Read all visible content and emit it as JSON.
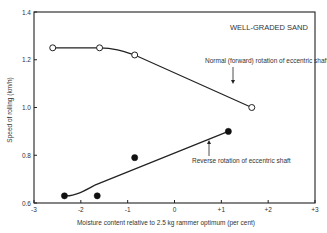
{
  "chart_data": {
    "type": "line",
    "title": "WELL-GRADED SAND",
    "xlabel": "Moisture content relative to 2.5 kg rammer optimum (per cent)",
    "ylabel": "Speed of rolling (km/h)",
    "xlim": [
      -3,
      3
    ],
    "ylim": [
      0.6,
      1.4
    ],
    "xticks": [
      -3,
      -2,
      -1,
      0,
      1,
      2,
      3
    ],
    "xtick_labels": [
      "-3",
      "-2",
      "-1",
      "0",
      "+1",
      "+2",
      "+3"
    ],
    "yticks": [
      0.6,
      0.8,
      1.0,
      1.2,
      1.4
    ],
    "ytick_labels": [
      "0.6",
      "0.8",
      "1.0",
      "1.2",
      "1.4"
    ],
    "grid": false,
    "series": [
      {
        "name": "Normal (forward) rotation of eccentric shaft",
        "marker": "open-circle",
        "x": [
          -2.6,
          -1.6,
          -0.85,
          1.65
        ],
        "y": [
          1.25,
          1.25,
          1.22,
          1.0
        ],
        "annotation": "Normal (forward) rotation of eccentric shaft"
      },
      {
        "name": "Reverse rotation of eccentric shaft",
        "marker": "filled-circle",
        "x": [
          -2.35,
          -1.65,
          -0.85,
          1.15
        ],
        "y": [
          0.63,
          0.63,
          0.79,
          0.9
        ],
        "annotation": "Reverse rotation of eccentric shaft"
      }
    ]
  }
}
